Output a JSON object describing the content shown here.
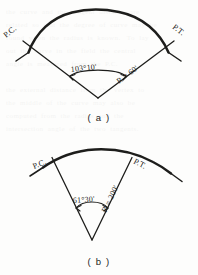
{
  "document": {
    "kind": "surveying-horizontal-curve-figure",
    "background_color": "#fdfdfc",
    "ink_color": "#1d1d1b",
    "showthrough_text": "the  curve  and  the  tangent  distance  are\nrelated  so  that  the  degree  of  curve  may  be\nfound  when  the  radius  is  known.   To  lay\nout  the  curve  in  the  field  the  central\nangle  is  measured  from  the  P.C.\n\nthe  external  distance  from  the  vertex  to\nthe  middle  of  the  curve  may  also  be\ncomputed  from  the  radius  and  the\nintersection  angle  of  the  two  tangents."
  },
  "figures": [
    {
      "id": "figure-a",
      "caption": "( a )",
      "pc_label": "P.C.",
      "pt_label": "P.T.",
      "angle_label": "103°10'",
      "radius_label": "R = 60'",
      "central_angle_degrees": 103,
      "central_angle_minutes": 10,
      "radius_value": 60,
      "radius_units": "ft"
    },
    {
      "id": "figure-b",
      "caption": "( b )",
      "pc_label": "P.C.",
      "pt_label": "P.T.",
      "angle_label": "61°30'",
      "radius_label": "R = 200'",
      "central_angle_degrees": 61,
      "central_angle_minutes": 30,
      "radius_value": 200,
      "radius_units": "ft"
    }
  ]
}
